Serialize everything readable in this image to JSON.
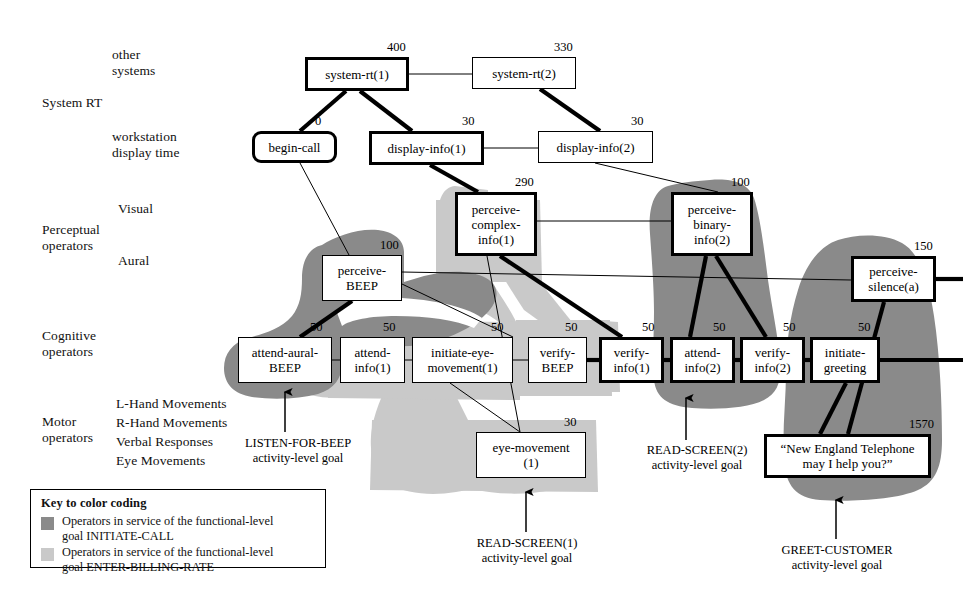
{
  "axis_labels": [
    {
      "name": "other-systems",
      "text": "other\nsystems",
      "x": 112,
      "y": 47
    },
    {
      "name": "system-rt",
      "text": "System RT",
      "x": 42,
      "y": 95
    },
    {
      "name": "workstation-display",
      "text": "workstation\ndisplay time",
      "x": 112,
      "y": 129
    },
    {
      "name": "visual",
      "text": "Visual",
      "x": 118,
      "y": 201
    },
    {
      "name": "perceptual-operators",
      "text": "Perceptual\noperators",
      "x": 42,
      "y": 222
    },
    {
      "name": "aural",
      "text": "Aural",
      "x": 118,
      "y": 253
    },
    {
      "name": "cognitive-operators",
      "text": "Cognitive\noperators",
      "x": 42,
      "y": 328
    },
    {
      "name": "l-hand-movements",
      "text": "L-Hand Movements",
      "x": 116,
      "y": 396
    },
    {
      "name": "motor-operators",
      "text": "Motor\noperators",
      "x": 42,
      "y": 414
    },
    {
      "name": "r-hand-movements",
      "text": "R-Hand Movements",
      "x": 116,
      "y": 415
    },
    {
      "name": "verbal-responses",
      "text": "Verbal Responses",
      "x": 116,
      "y": 434
    },
    {
      "name": "eye-movements",
      "text": "Eye Movements",
      "x": 116,
      "y": 453
    }
  ],
  "nodes": [
    {
      "id": "system-rt-1",
      "label": "system-rt(1)",
      "duration": "400",
      "x": 305,
      "y": 57,
      "w": 104,
      "h": 34,
      "bold": true,
      "round": false
    },
    {
      "id": "system-rt-2",
      "label": "system-rt(2)",
      "duration": "330",
      "x": 472,
      "y": 57,
      "w": 104,
      "h": 32,
      "bold": false,
      "round": false
    },
    {
      "id": "begin-call",
      "label": "begin-call",
      "duration": "0",
      "x": 252,
      "y": 131,
      "w": 85,
      "h": 32,
      "bold": true,
      "round": true
    },
    {
      "id": "display-info-1",
      "label": "display-info(1)",
      "duration": "30",
      "x": 369,
      "y": 131,
      "w": 115,
      "h": 34,
      "bold": true,
      "round": false
    },
    {
      "id": "display-info-2",
      "label": "display-info(2)",
      "duration": "30",
      "x": 538,
      "y": 131,
      "w": 115,
      "h": 32,
      "bold": false,
      "round": false
    },
    {
      "id": "perceive-complex-info-1",
      "label": "perceive-\ncomplex-\ninfo(1)",
      "duration": "290",
      "x": 455,
      "y": 192,
      "w": 82,
      "h": 64,
      "bold": true,
      "round": false
    },
    {
      "id": "perceive-binary-info-2",
      "label": "perceive-\nbinary-\ninfo(2)",
      "duration": "100",
      "x": 671,
      "y": 192,
      "w": 82,
      "h": 64,
      "bold": true,
      "round": false
    },
    {
      "id": "perceive-beep",
      "label": "perceive-\nBEEP",
      "duration": "100",
      "x": 322,
      "y": 255,
      "w": 80,
      "h": 46,
      "bold": false,
      "round": false
    },
    {
      "id": "perceive-silence-a",
      "label": "perceive-\nsilence(a)",
      "duration": "150",
      "x": 851,
      "y": 256,
      "w": 85,
      "h": 46,
      "bold": true,
      "round": false
    },
    {
      "id": "attend-aural-beep",
      "label": "attend-aural-\nBEEP",
      "duration": "50",
      "x": 238,
      "y": 337,
      "w": 94,
      "h": 46,
      "bold": false,
      "round": false
    },
    {
      "id": "attend-info-1",
      "label": "attend-\ninfo(1)",
      "duration": "50",
      "x": 340,
      "y": 337,
      "w": 65,
      "h": 46,
      "bold": false,
      "round": false
    },
    {
      "id": "initiate-eye-movement-1",
      "label": "initiate-eye-\nmovement(1)",
      "duration": "50",
      "x": 412,
      "y": 337,
      "w": 101,
      "h": 46,
      "bold": false,
      "round": false
    },
    {
      "id": "verify-beep",
      "label": "verify-\nBEEP",
      "duration": "50",
      "x": 528,
      "y": 337,
      "w": 59,
      "h": 46,
      "bold": false,
      "round": false
    },
    {
      "id": "verify-info-1",
      "label": "verify-\ninfo(1)",
      "duration": "50",
      "x": 599,
      "y": 337,
      "w": 65,
      "h": 46,
      "bold": true,
      "round": false
    },
    {
      "id": "attend-info-2",
      "label": "attend-\ninfo(2)",
      "duration": "50",
      "x": 670,
      "y": 337,
      "w": 65,
      "h": 46,
      "bold": true,
      "round": false
    },
    {
      "id": "verify-info-2",
      "label": "verify-\ninfo(2)",
      "duration": "50",
      "x": 740,
      "y": 337,
      "w": 65,
      "h": 46,
      "bold": true,
      "round": false
    },
    {
      "id": "initiate-greeting",
      "label": "initiate-\ngreeting",
      "duration": "50",
      "x": 810,
      "y": 337,
      "w": 70,
      "h": 46,
      "bold": true,
      "round": false
    },
    {
      "id": "eye-movement-1",
      "label": "eye-movement\n(1)",
      "duration": "30",
      "x": 476,
      "y": 432,
      "w": 110,
      "h": 46,
      "bold": false,
      "round": false
    },
    {
      "id": "greeting-utterance",
      "label": "“New England Telephone\nmay I help you?”",
      "duration": "1570",
      "x": 764,
      "y": 434,
      "w": 167,
      "h": 44,
      "bold": true,
      "round": false
    }
  ],
  "goals": [
    {
      "id": "listen-for-beep",
      "line1": "LISTEN-FOR-BEEP",
      "line2": "activity-level goal",
      "x": 232,
      "y": 436,
      "w": 132
    },
    {
      "id": "read-screen-2",
      "line1": "READ-SCREEN(2)",
      "line2": "activity-level goal",
      "x": 633,
      "y": 443,
      "w": 128
    },
    {
      "id": "read-screen-1",
      "line1": "READ-SCREEN(1)",
      "line2": "activity-level goal",
      "x": 463,
      "y": 536,
      "w": 128
    },
    {
      "id": "greet-customer",
      "line1": "GREET-CUSTOMER",
      "line2": "activity-level goal",
      "x": 767,
      "y": 543,
      "w": 140
    }
  ],
  "legend": {
    "title": "Key to color coding",
    "rows": [
      {
        "id": "initiate-call",
        "color": "#8a8a8a",
        "text": "Operators in service of the functional-level\ngoal INITIATE-CALL"
      },
      {
        "id": "enter-billing-rate",
        "color": "#c9c9c9",
        "text": "Operators in service of the functional-level\ngoal ENTER-BILLING-RATE"
      }
    ]
  },
  "colors": {
    "dark_shade": "#8a8a8a",
    "light_shade": "#c9c9c9",
    "line": "#000000",
    "background": "#ffffff"
  },
  "edges": [
    {
      "from": "system-rt-1",
      "to": "system-rt-2",
      "weight": "thin"
    },
    {
      "from": "system-rt-1",
      "to": "begin-call",
      "weight": "thick"
    },
    {
      "from": "system-rt-1",
      "to": "display-info-1",
      "weight": "thick"
    },
    {
      "from": "system-rt-2",
      "to": "display-info-2",
      "weight": "thick"
    },
    {
      "from": "display-info-1",
      "to": "display-info-2",
      "weight": "thin"
    },
    {
      "from": "begin-call",
      "to": "perceive-beep",
      "weight": "thin"
    },
    {
      "from": "display-info-1",
      "to": "perceive-complex-info-1",
      "weight": "thick"
    },
    {
      "from": "display-info-2",
      "to": "perceive-binary-info-2",
      "weight": "thin"
    },
    {
      "from": "perceive-complex-info-1",
      "to": "perceive-binary-info-2",
      "weight": "thin"
    },
    {
      "from": "perceive-beep",
      "to": "perceive-silence-a",
      "weight": "thin"
    },
    {
      "from": "perceive-beep",
      "to": "attend-aural-beep",
      "weight": "thick"
    },
    {
      "from": "perceive-beep",
      "to": "verify-info-1",
      "weight": "thick"
    },
    {
      "from": "perceive-complex-info-1",
      "to": "eye-movement-1",
      "weight": "thin"
    },
    {
      "from": "perceive-complex-info-1",
      "to": "verify-info-1",
      "weight": "thick"
    },
    {
      "from": "perceive-binary-info-2",
      "to": "attend-info-2",
      "weight": "thick"
    },
    {
      "from": "perceive-binary-info-2",
      "to": "verify-info-2",
      "weight": "thick"
    },
    {
      "from": "perceive-silence-a",
      "to": "greeting-utterance",
      "weight": "thick"
    },
    {
      "from": "attend-aural-beep",
      "to": "attend-info-1",
      "weight": "thin"
    },
    {
      "from": "attend-info-1",
      "to": "initiate-eye-movement-1",
      "weight": "thin"
    },
    {
      "from": "initiate-eye-movement-1",
      "to": "verify-beep",
      "weight": "thin"
    },
    {
      "from": "verify-beep",
      "to": "verify-info-1",
      "weight": "thick"
    },
    {
      "from": "verify-info-1",
      "to": "attend-info-2",
      "weight": "thick"
    },
    {
      "from": "attend-info-2",
      "to": "verify-info-2",
      "weight": "thick"
    },
    {
      "from": "verify-info-2",
      "to": "initiate-greeting",
      "weight": "thick"
    },
    {
      "from": "initiate-eye-movement-1",
      "to": "eye-movement-1",
      "weight": "thin"
    },
    {
      "from": "initiate-greeting",
      "to": "greeting-utterance",
      "weight": "thick"
    }
  ]
}
